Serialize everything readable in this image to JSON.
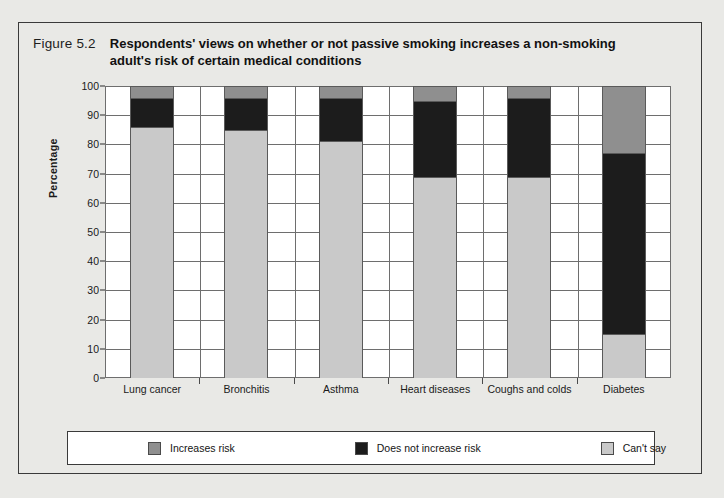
{
  "figure": {
    "number": "Figure 5.2",
    "title": "Respondents' views on whether or not passive smoking increases a non-smoking adult's risk of certain medical conditions"
  },
  "chart_data": {
    "type": "bar",
    "stacked": true,
    "title": "Respondents' views on whether or not passive smoking increases a non-smoking adult's risk of certain medical conditions",
    "xlabel": "",
    "ylabel": "Percentage",
    "ylim": [
      0,
      100
    ],
    "ytick_step": 10,
    "yticks": [
      "0",
      "10",
      "20",
      "30",
      "40",
      "50",
      "60",
      "70",
      "80",
      "90",
      "100"
    ],
    "grid": true,
    "legend_position": "bottom",
    "categories": [
      "Lung cancer",
      "Bronchitis",
      "Asthma",
      "Heart diseases",
      "Coughs and colds",
      "Diabetes"
    ],
    "series": [
      {
        "name": "Increases risk",
        "color": "#c9c9c9",
        "values": [
          86,
          85,
          81,
          69,
          69,
          15
        ]
      },
      {
        "name": "Does not increase risk",
        "color": "#1c1c1c",
        "values": [
          10,
          11,
          15,
          26,
          27,
          62
        ]
      },
      {
        "name": "Can't say",
        "color": "#8f8f8f",
        "values": [
          4,
          4,
          4,
          5,
          4,
          23
        ]
      }
    ]
  },
  "legend": {
    "items": [
      {
        "label": "Increases risk",
        "swatch": "increases-risk-swatch"
      },
      {
        "label": "Does not increase risk",
        "swatch": "does-not-increase-risk-swatch"
      },
      {
        "label": "Can't say",
        "swatch": "cant-say-swatch"
      }
    ]
  }
}
